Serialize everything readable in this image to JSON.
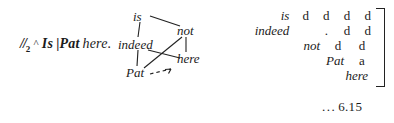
{
  "figure": {
    "reference_number": "… 6.15",
    "reference_dots": "...",
    "reference_value": "6.15"
  },
  "sentence": {
    "slashes": "//",
    "subscript": "2",
    "caret": "^",
    "word_is": "Is",
    "bar": "|",
    "word_pat": "Pat",
    "word_here": "here.",
    "full_text": "//2 ^ Is |Pat here."
  },
  "diagram": {
    "nodes": [
      {
        "id": "is",
        "label": "is"
      },
      {
        "id": "not",
        "label": "not"
      },
      {
        "id": "indeed",
        "label": "indeed"
      },
      {
        "id": "here",
        "label": "here"
      },
      {
        "id": "pat",
        "label": "Pat"
      }
    ],
    "edges": [
      {
        "from": "is",
        "to": "not",
        "style": "solid"
      },
      {
        "from": "is",
        "to": "indeed",
        "style": "solid"
      },
      {
        "from": "indeed",
        "to": "pat",
        "style": "solid"
      },
      {
        "from": "not",
        "to": "here",
        "style": "solid"
      },
      {
        "from": "not",
        "to": "pat",
        "style": "solid"
      },
      {
        "from": "indeed",
        "to": "here",
        "style": "solid"
      },
      {
        "from": "pat",
        "to": "arrow",
        "style": "dashed-arrow"
      }
    ]
  },
  "matrix": {
    "rows": [
      {
        "label": "is",
        "cells": [
          "d",
          "d",
          "d",
          "d"
        ]
      },
      {
        "label": "indeed",
        "cells": [
          "",
          ".",
          "d",
          "d"
        ]
      },
      {
        "label": "not",
        "cells": [
          "",
          "",
          "d",
          "d"
        ]
      },
      {
        "label": "Pat",
        "cells": [
          "",
          "",
          "",
          "a"
        ]
      },
      {
        "label": "here",
        "cells": [
          "",
          "",
          "",
          ""
        ]
      }
    ],
    "row_labels_inline": [
      "is",
      "indeed",
      "not",
      "Pat",
      "here"
    ],
    "bracket": "]"
  },
  "colors": {
    "ink": "#1b1b1b",
    "background": "#ffffff"
  }
}
